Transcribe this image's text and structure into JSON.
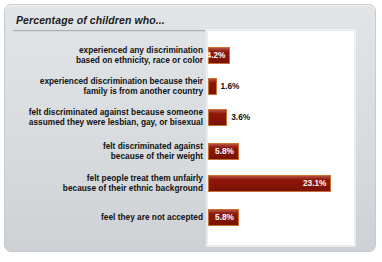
{
  "chart_data": {
    "type": "bar",
    "orientation": "horizontal",
    "title": "Percentage of children who...",
    "xlabel": "",
    "ylabel": "",
    "xlim": [
      0,
      27.5
    ],
    "grid": false,
    "legend": "none",
    "value_suffix": "%",
    "bar_color": "#8a1507",
    "bar_border_color": "#c8702f",
    "categories": [
      "experienced any discrimination\nbased on ethnicity, race or color",
      "experienced discrimination because their\nfamily is from another country",
      "felt discriminated against because someone\nassumed they were lesbian, gay, or bisexual",
      "felt discriminated against\nbecause of their weight",
      "felt people treat them unfairly\nbecause of their ethnic background",
      "feel they are not accepted"
    ],
    "values": [
      4.2,
      1.6,
      3.6,
      5.8,
      23.1,
      5.8
    ],
    "value_labels": [
      "4.2%",
      "1.6%",
      "3.6%",
      "5.8%",
      "23.1%",
      "5.8%"
    ],
    "label_placement": [
      "inside",
      "outside",
      "outside",
      "inside",
      "inside",
      "inside"
    ]
  }
}
